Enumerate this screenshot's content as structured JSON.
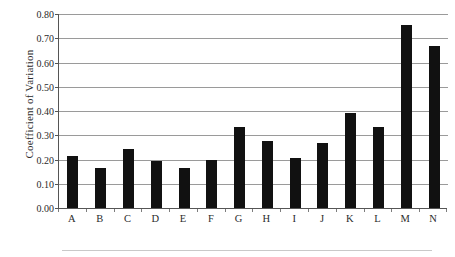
{
  "chart_data": {
    "type": "bar",
    "title": "",
    "xlabel": "",
    "ylabel": "Coefficient of Variation",
    "categories": [
      "A",
      "B",
      "C",
      "D",
      "E",
      "F",
      "G",
      "H",
      "I",
      "J",
      "K",
      "L",
      "M",
      "N"
    ],
    "values": [
      0.215,
      0.165,
      0.245,
      0.195,
      0.165,
      0.2,
      0.335,
      0.275,
      0.205,
      0.27,
      0.39,
      0.335,
      0.755,
      0.67
    ],
    "ylim": [
      0.0,
      0.8
    ],
    "ytick_step": 0.1,
    "ytick_labels": [
      "0.00",
      "0.10",
      "0.20",
      "0.30",
      "0.40",
      "0.50",
      "0.60",
      "0.70",
      "0.80"
    ],
    "ytick_values": [
      0.0,
      0.1,
      0.2,
      0.3,
      0.4,
      0.5,
      0.6,
      0.7,
      0.8
    ],
    "grid": "horizontal",
    "legend": "none",
    "series": [
      {
        "name": "Coefficient of Variation",
        "color": "#111111",
        "values": [
          0.215,
          0.165,
          0.245,
          0.195,
          0.165,
          0.2,
          0.335,
          0.275,
          0.205,
          0.27,
          0.39,
          0.335,
          0.755,
          0.67
        ]
      }
    ],
    "colors": {
      "bar": "#111111",
      "grid": "#9a9a9a",
      "axis": "#555555",
      "text": "#2b2b2b",
      "background": "#ffffff"
    }
  }
}
